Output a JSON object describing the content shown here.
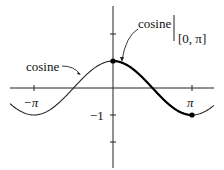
{
  "diagram": {
    "labels": {
      "cosine_full": "cosine",
      "cosine_restricted": "cosine",
      "restriction": "[0, π]",
      "x_neg_pi": "−π",
      "x_pi": "π",
      "y_neg_one": "−1"
    },
    "axes": {
      "x_ticks": [
        "−π",
        "π"
      ],
      "y_ticks": [
        "2",
        "−1",
        "−2"
      ]
    },
    "curve": {
      "function": "cos x",
      "highlight_interval": "[0, π]",
      "endpoints": [
        "(0, 1)",
        "(π, −1)"
      ]
    }
  }
}
